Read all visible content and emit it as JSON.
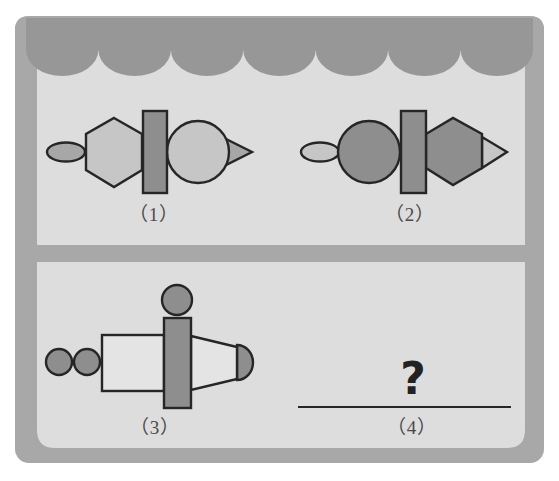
{
  "colors": {
    "frame": "#a8a8a8",
    "frame_shadow": "#9a9a9a",
    "panel": "#dddddd",
    "scallop": "#979797",
    "stroke": "#262626",
    "fill_dark": "#8e8e8e",
    "fill_mid": "#a7a7a7",
    "fill_light": "#c6c6c6",
    "fill_white": "#e4e4e4"
  },
  "panels": {
    "top": {
      "figures": [
        {
          "id": "1",
          "label": "（1）",
          "parts": [
            "ellipse (dark)",
            "hexagon (light, flat sides vertical)",
            "rectangle (dark, vertical)",
            "circle (light)",
            "triangle (dark, pointing right)"
          ]
        },
        {
          "id": "2",
          "label": "（2）",
          "parts": [
            "ellipse (light)",
            "circle (dark)",
            "rectangle (dark, vertical)",
            "hexagon (dark)",
            "triangle (light, pointing right)"
          ]
        }
      ]
    },
    "bottom": {
      "figures": [
        {
          "id": "3",
          "label": "（3）",
          "parts": [
            "two small circles (dark)",
            "rectangle (white)",
            "circle on top (dark)",
            "tall rectangle (dark)",
            "trapezoid (white)",
            "semicircle (dark)"
          ]
        },
        {
          "id": "4",
          "label": "（4）",
          "question_mark": "?"
        }
      ]
    }
  }
}
